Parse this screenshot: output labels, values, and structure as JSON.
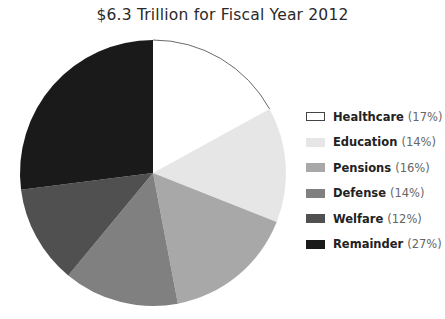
{
  "chart_data": {
    "type": "pie",
    "title": "$6.3 Trillion for Fiscal Year 2012",
    "categories": [
      "Healthcare",
      "Education",
      "Pensions",
      "Defense",
      "Welfare",
      "Remainder"
    ],
    "values": [
      17,
      14,
      16,
      14,
      12,
      27
    ],
    "unit": "%",
    "colors": [
      "#ffffff",
      "#e6e6e6",
      "#a8a8a8",
      "#808080",
      "#505050",
      "#1a1a1a"
    ],
    "start_angle": "top",
    "direction": "clockwise",
    "legend_position": "right",
    "legend": [
      {
        "label": "Healthcare",
        "pct": "(17%)"
      },
      {
        "label": "Education",
        "pct": "(14%)"
      },
      {
        "label": "Pensions",
        "pct": "(16%)"
      },
      {
        "label": "Defense",
        "pct": "(14%)"
      },
      {
        "label": "Welfare",
        "pct": "(12%)"
      },
      {
        "label": "Remainder",
        "pct": "(27%)"
      }
    ]
  }
}
